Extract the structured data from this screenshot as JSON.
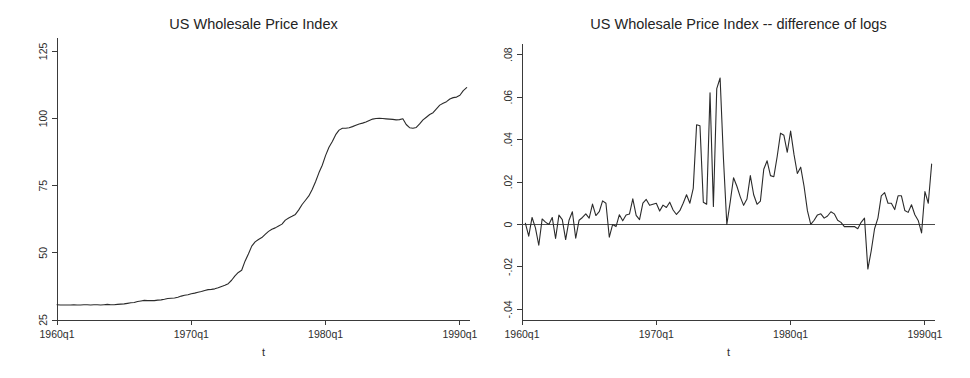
{
  "figure": {
    "width": 970,
    "height": 378,
    "background": "#ffffff",
    "line_color": "#2b2b2b",
    "axis_color": "#3a3a3a",
    "text_color": "#2e2e2e"
  },
  "chart_data": [
    {
      "type": "line",
      "id": "levels",
      "title": "US Wholesale Price Index",
      "xlabel": "t",
      "ylabel": "",
      "grid": false,
      "legend": "none",
      "xlim": [
        1960.0,
        1990.75
      ],
      "ylim": [
        25,
        130
      ],
      "xticks": [
        1960,
        1970,
        1980,
        1990
      ],
      "xticklabels": [
        "1960q1",
        "1970q1",
        "1980q1",
        "1990q1"
      ],
      "yticks": [
        25,
        50,
        75,
        100,
        125
      ],
      "yticklabels": [
        "25",
        "50",
        "75",
        "100",
        "125"
      ],
      "x": [
        1960.0,
        1960.25,
        1960.5,
        1960.75,
        1961.0,
        1961.25,
        1961.5,
        1961.75,
        1962.0,
        1962.25,
        1962.5,
        1962.75,
        1963.0,
        1963.25,
        1963.5,
        1963.75,
        1964.0,
        1964.25,
        1964.5,
        1964.75,
        1965.0,
        1965.25,
        1965.5,
        1965.75,
        1966.0,
        1966.25,
        1966.5,
        1966.75,
        1967.0,
        1967.25,
        1967.5,
        1967.75,
        1968.0,
        1968.25,
        1968.5,
        1968.75,
        1969.0,
        1969.25,
        1969.5,
        1969.75,
        1970.0,
        1970.25,
        1970.5,
        1970.75,
        1971.0,
        1971.25,
        1971.5,
        1971.75,
        1972.0,
        1972.25,
        1972.5,
        1972.75,
        1973.0,
        1973.25,
        1973.5,
        1973.75,
        1974.0,
        1974.25,
        1974.5,
        1974.75,
        1975.0,
        1975.25,
        1975.5,
        1975.75,
        1976.0,
        1976.25,
        1976.5,
        1976.75,
        1977.0,
        1977.25,
        1977.5,
        1977.75,
        1978.0,
        1978.25,
        1978.5,
        1978.75,
        1979.0,
        1979.25,
        1979.5,
        1979.75,
        1980.0,
        1980.25,
        1980.5,
        1980.75,
        1981.0,
        1981.25,
        1981.5,
        1981.75,
        1982.0,
        1982.25,
        1982.5,
        1982.75,
        1983.0,
        1983.25,
        1983.5,
        1983.75,
        1984.0,
        1984.25,
        1984.5,
        1984.75,
        1985.0,
        1985.25,
        1985.5,
        1985.75,
        1986.0,
        1986.25,
        1986.5,
        1986.75,
        1987.0,
        1987.25,
        1987.5,
        1987.75,
        1988.0,
        1988.25,
        1988.5,
        1988.75,
        1989.0,
        1989.25,
        1989.5,
        1989.75,
        1990.0,
        1990.25,
        1990.5
      ],
      "y": [
        30.7,
        30.6,
        30.6,
        30.6,
        30.6,
        30.7,
        30.6,
        30.6,
        30.7,
        30.7,
        30.6,
        30.7,
        30.7,
        30.6,
        30.7,
        30.8,
        30.7,
        30.7,
        30.8,
        30.9,
        31.0,
        31.2,
        31.4,
        31.5,
        31.9,
        32.1,
        32.3,
        32.2,
        32.2,
        32.2,
        32.4,
        32.5,
        32.7,
        33.0,
        33.1,
        33.2,
        33.5,
        33.9,
        34.2,
        34.4,
        34.8,
        35.0,
        35.3,
        35.6,
        36.0,
        36.3,
        36.4,
        36.6,
        37.0,
        37.5,
        37.9,
        38.5,
        39.8,
        41.4,
        42.7,
        43.5,
        46.9,
        49.6,
        52.5,
        54.1,
        55.0,
        55.7,
        56.9,
        58.0,
        58.8,
        59.3,
        60.0,
        60.7,
        62.2,
        63.0,
        63.6,
        64.3,
        66.0,
        68.0,
        69.6,
        71.2,
        73.6,
        76.5,
        79.8,
        82.6,
        86.3,
        89.3,
        91.5,
        94.0,
        95.7,
        96.4,
        96.4,
        96.6,
        97.0,
        97.5,
        98.0,
        98.3,
        98.7,
        99.3,
        99.8,
        100.0,
        100.1,
        100.0,
        99.9,
        99.8,
        99.7,
        99.5,
        99.6,
        99.9,
        97.8,
        96.6,
        96.4,
        96.7,
        98.0,
        99.5,
        100.5,
        101.5,
        102.2,
        103.6,
        105.0,
        105.7,
        106.3,
        107.3,
        107.8,
        108.0,
        108.7,
        110.4,
        111.5
      ]
    },
    {
      "type": "line",
      "id": "dlog",
      "title": "US Wholesale Price Index -- difference of logs",
      "xlabel": "t",
      "ylabel": "",
      "grid": false,
      "legend": "none",
      "xlim": [
        1960.0,
        1990.75
      ],
      "ylim": [
        -0.045,
        0.085
      ],
      "xticks": [
        1960,
        1970,
        1980,
        1990
      ],
      "xticklabels": [
        "1960q1",
        "1970q1",
        "1980q1",
        "1990q1"
      ],
      "yticks": [
        -0.04,
        -0.02,
        0,
        0.02,
        0.04,
        0.06,
        0.08
      ],
      "yticklabels": [
        "-.04",
        "-.02",
        "0",
        ".02",
        ".04",
        ".06",
        ".08"
      ],
      "zero_line": 0,
      "x": [
        1960.25,
        1960.5,
        1960.75,
        1961.0,
        1961.25,
        1961.5,
        1961.75,
        1962.0,
        1962.25,
        1962.5,
        1962.75,
        1963.0,
        1963.25,
        1963.5,
        1963.75,
        1964.0,
        1964.25,
        1964.5,
        1964.75,
        1965.0,
        1965.25,
        1965.5,
        1965.75,
        1966.0,
        1966.25,
        1966.5,
        1966.75,
        1967.0,
        1967.25,
        1967.5,
        1967.75,
        1968.0,
        1968.25,
        1968.5,
        1968.75,
        1969.0,
        1969.25,
        1969.5,
        1969.75,
        1970.0,
        1970.25,
        1970.5,
        1970.75,
        1971.0,
        1971.25,
        1971.5,
        1971.75,
        1972.0,
        1972.25,
        1972.5,
        1972.75,
        1973.0,
        1973.25,
        1973.5,
        1973.75,
        1974.0,
        1974.25,
        1974.5,
        1974.75,
        1975.0,
        1975.25,
        1975.5,
        1975.75,
        1976.0,
        1976.25,
        1976.5,
        1976.75,
        1977.0,
        1977.25,
        1977.5,
        1977.75,
        1978.0,
        1978.25,
        1978.5,
        1978.75,
        1979.0,
        1979.25,
        1979.5,
        1979.75,
        1980.0,
        1980.25,
        1980.5,
        1980.75,
        1981.0,
        1981.25,
        1981.5,
        1981.75,
        1982.0,
        1982.25,
        1982.5,
        1982.75,
        1983.0,
        1983.25,
        1983.5,
        1983.75,
        1984.0,
        1984.25,
        1984.5,
        1984.75,
        1985.0,
        1985.25,
        1985.5,
        1985.75,
        1986.0,
        1986.25,
        1986.5,
        1986.75,
        1987.0,
        1987.25,
        1987.5,
        1987.75,
        1988.0,
        1988.25,
        1988.5,
        1988.75,
        1989.0,
        1989.25,
        1989.5,
        1989.75,
        1990.0,
        1990.25,
        1990.5
      ],
      "y": [
        0.0006,
        -0.0055,
        0.0033,
        -0.0016,
        -0.0098,
        0.0026,
        0.0011,
        0.0,
        0.0033,
        -0.0066,
        0.0044,
        0.0023,
        -0.0071,
        0.002,
        0.006,
        -0.0065,
        0.002,
        0.0033,
        0.005,
        0.003,
        0.0096,
        0.0042,
        0.006,
        0.0111,
        0.01,
        -0.006,
        0.0,
        -0.001,
        0.0046,
        0.0017,
        0.0045,
        0.0049,
        0.0121,
        0.0043,
        0.0023,
        0.01,
        0.0118,
        0.009,
        0.0095,
        0.01,
        0.0063,
        0.0091,
        0.008,
        0.0105,
        0.0068,
        0.0047,
        0.0065,
        0.01,
        0.014,
        0.01,
        0.017,
        0.047,
        0.0465,
        0.0105,
        0.0095,
        0.062,
        0.0085,
        0.064,
        0.069,
        0.031,
        0.0,
        0.0105,
        0.022,
        0.018,
        0.013,
        0.009,
        0.012,
        0.023,
        0.014,
        0.0095,
        0.011,
        0.026,
        0.03,
        0.023,
        0.0225,
        0.032,
        0.043,
        0.042,
        0.034,
        0.044,
        0.033,
        0.024,
        0.027,
        0.018,
        0.0065,
        0.0,
        0.002,
        0.0045,
        0.005,
        0.003,
        0.004,
        0.006,
        0.005,
        0.002,
        0.001,
        -0.001,
        -0.001,
        -0.001,
        -0.001,
        -0.002,
        0.001,
        0.003,
        -0.021,
        -0.0125,
        -0.002,
        0.003,
        0.0135,
        0.015,
        0.01,
        0.01,
        0.007,
        0.0135,
        0.0135,
        0.0066,
        0.0057,
        0.0093,
        0.0046,
        0.0019,
        -0.004,
        0.0155,
        0.01,
        0.0285
      ]
    }
  ]
}
